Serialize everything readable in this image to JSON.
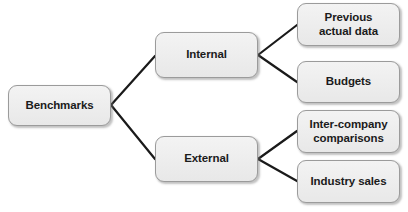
{
  "diagram": {
    "type": "tree",
    "orientation": "left-to-right",
    "background_color": "#ffffff",
    "node_fill_color": "#ececec",
    "node_border_color": "#9b9b9b",
    "node_text_color": "#1b1b1b",
    "connector_color": "#1a1a1a",
    "nodes": {
      "root": {
        "id": "benchmarks",
        "label": "Benchmarks"
      },
      "internal": {
        "id": "internal",
        "label": "Internal"
      },
      "external": {
        "id": "external",
        "label": "External"
      },
      "previous_actual_data": {
        "id": "previous-actual-data",
        "label": "Previous\nactual data"
      },
      "budgets": {
        "id": "budgets",
        "label": "Budgets"
      },
      "inter_company_comparisons": {
        "id": "inter-company-comparisons",
        "label": "Inter-company\ncomparisons"
      },
      "industry_sales": {
        "id": "industry-sales",
        "label": "Industry sales"
      }
    },
    "edges": [
      {
        "from": "benchmarks",
        "to": "internal",
        "x1": 111,
        "y1": 105,
        "x2": 155,
        "y2": 56
      },
      {
        "from": "benchmarks",
        "to": "external",
        "x1": 111,
        "y1": 105,
        "x2": 155,
        "y2": 159
      },
      {
        "from": "internal",
        "to": "previous-actual-data",
        "x1": 258,
        "y1": 55,
        "x2": 297,
        "y2": 25
      },
      {
        "from": "internal",
        "to": "budgets",
        "x1": 258,
        "y1": 55,
        "x2": 297,
        "y2": 82
      },
      {
        "from": "external",
        "to": "inter-company-comparisons",
        "x1": 258,
        "y1": 159,
        "x2": 297,
        "y2": 131
      },
      {
        "from": "external",
        "to": "industry-sales",
        "x1": 258,
        "y1": 159,
        "x2": 297,
        "y2": 181
      }
    ]
  }
}
